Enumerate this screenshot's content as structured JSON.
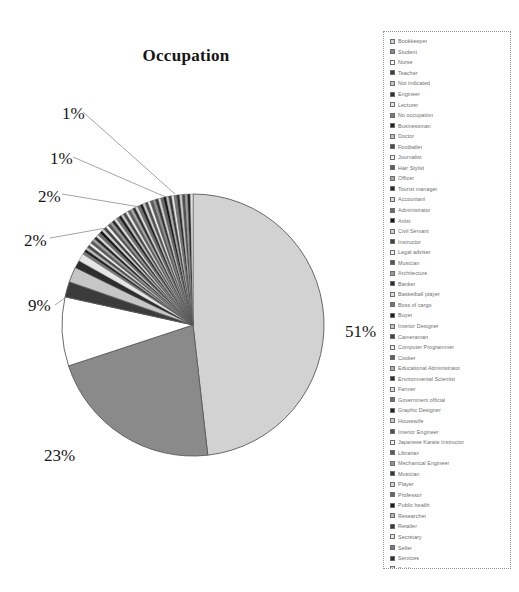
{
  "chart_data": {
    "type": "pie",
    "title": "Occupation",
    "xlabel": "",
    "ylabel": "",
    "legend_position": "right",
    "grid": false,
    "value_unit": "%",
    "labeled_values": [
      "51%",
      "23%",
      "9%",
      "2%",
      "2%",
      "1%",
      "1%"
    ],
    "categories": [
      "Bookkeeper",
      "Student",
      "Nurse",
      "Teacher",
      "Not indicated",
      "Engineer",
      "Lecturer",
      "No occupation",
      "Businessman",
      "Doctor",
      "Footballer",
      "Journalist",
      "Hair Stylist",
      "Officer",
      "Tourist manager",
      "Accountant",
      "Administrator",
      "Artist",
      "Civil Servant",
      "Instructor",
      "Legal adviser",
      "Musician",
      "Architecture",
      "Banker",
      "Basketball player",
      "Boss of cargo",
      "Buyer",
      "Interior Designer",
      "Cameraman",
      "Computer Programmer",
      "Cooker",
      "Educational Administrator",
      "Environmental Scientist",
      "Farmer",
      "Government official",
      "Graphic Designer",
      "Housewife",
      "Interior Engineer",
      "Japanese Karate Instructor",
      "Librarian",
      "Mechanical Engineer",
      "Musician",
      "Player",
      "Professor",
      "Public health",
      "Researcher",
      "Retailer",
      "Secretary",
      "Seller",
      "Services",
      "Soldier",
      "System Analyst",
      "Tutorial assistant",
      "US assistant",
      "worker"
    ],
    "values": [
      51,
      23,
      9,
      2,
      2,
      1,
      1,
      0.35,
      0.35,
      0.35,
      0.35,
      0.35,
      0.35,
      0.35,
      0.35,
      0.35,
      0.35,
      0.35,
      0.35,
      0.35,
      0.35,
      0.35,
      0.35,
      0.35,
      0.35,
      0.35,
      0.35,
      0.35,
      0.35,
      0.35,
      0.35,
      0.35,
      0.35,
      0.35,
      0.35,
      0.35,
      0.35,
      0.35,
      0.35,
      0.35,
      0.35,
      0.35,
      0.35,
      0.35,
      0.35,
      0.35,
      0.35,
      0.35,
      0.35,
      0.35,
      0.35,
      0.35,
      0.35,
      0.35,
      0.35
    ],
    "slice_colors": [
      "#d2d2d2",
      "#8a8a8a",
      "#ffffff",
      "#3b3b3b",
      "#c6c6c6",
      "#2d2d2d",
      "#e6e6e6",
      "#7a7a7a",
      "#1f1f1f",
      "#bdbdbd",
      "#4a4a4a",
      "#ededed",
      "#5c5c5c",
      "#a5a5a5",
      "#262626",
      "#d8d8d8",
      "#6b6b6b",
      "#141414",
      "#cfcfcf",
      "#3f3f3f",
      "#f2f2f2",
      "#565656",
      "#9b9b9b",
      "#2a2a2a",
      "#e0e0e0",
      "#747474",
      "#1a1a1a",
      "#c2c2c2",
      "#454545",
      "#eaeaea",
      "#616161",
      "#ababab",
      "#303030",
      "#dcdcdc",
      "#707070",
      "#222222",
      "#c9c9c9",
      "#4e4e4e",
      "#f0f0f0",
      "#5a5a5a",
      "#949494",
      "#343434",
      "#d5d5d5",
      "#676767",
      "#181818",
      "#b6b6b6",
      "#3a3a3a",
      "#e4e4e4",
      "#787878",
      "#2e2e2e",
      "#cccccc",
      "#505050",
      "#a0a0a0",
      "#242424",
      "#dfdfdf"
    ]
  },
  "labels": {
    "p51": "51%",
    "p23": "23%",
    "p9": "9%",
    "p2a": "2%",
    "p2b": "2%",
    "p1a": "1%",
    "p1b": "1%"
  },
  "colors": {
    "slice_large": "#d2d2d2",
    "slice_medium": "#8a8a8a",
    "slice_white": "#ffffff",
    "outline": "#5a5a5a",
    "legend_border": "#9a9a9a",
    "legend_text": "#6f6f6f",
    "title_text": "#151515"
  }
}
